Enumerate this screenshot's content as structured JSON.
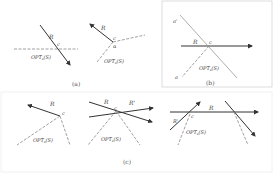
{
  "figure": {
    "panels": [
      {
        "id": "a",
        "caption": "(a)",
        "subfigures": [
          {
            "ray_label": "R",
            "point_label": "c",
            "region_label": "OPT_s(S)"
          },
          {
            "ray_label": "R",
            "point_label": "c",
            "angle_label": "α",
            "region_label": "OPT_s(S)"
          }
        ]
      },
      {
        "id": "b",
        "caption": "(b)",
        "subfigures": [
          {
            "ray_label": "R",
            "point_label": "c",
            "line_end_labels": [
              "a'",
              "a"
            ],
            "region_label": "OPT_s(S)"
          }
        ]
      },
      {
        "id": "c",
        "caption": "(c)",
        "subfigures": [
          {
            "ray_label": "R",
            "point_label": "c",
            "region_label": "OPT_s(S)"
          },
          {
            "ray_label": "R",
            "ray2_label": "R'",
            "point_label": "c",
            "region_label": "OPT_s(S)"
          },
          {
            "ray_label": "R",
            "ray2_label": "R'",
            "point_label": "c",
            "region_label": "OPT_s(S)"
          },
          {
            "note": "crossing rays without labels"
          }
        ]
      }
    ],
    "colors": {
      "solid_ray": "#333333",
      "dashed_line": "#888888",
      "text": "#444444"
    }
  },
  "labels": {
    "R": "R",
    "Rp": "R'",
    "c": "c",
    "alpha": "α",
    "ap": "a'",
    "a": "a",
    "opt_main": "OPT",
    "opt_sub": "s",
    "opt_arg": "(S)",
    "cap_a": "(a)",
    "cap_b": "(b)",
    "cap_c": "(c)"
  }
}
